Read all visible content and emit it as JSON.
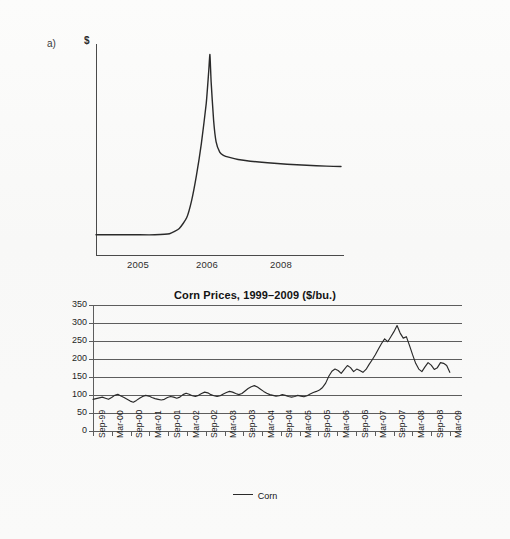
{
  "figure": {
    "background_color": "#fbfbfa",
    "line_color": "#2a2a2a"
  },
  "panel_a": {
    "letter": "a)",
    "y_axis_label": "$",
    "x_tick_labels": [
      "2005",
      "2006",
      "2008"
    ],
    "chart_data": {
      "type": "line",
      "title": "",
      "xlabel": "",
      "ylabel": "$",
      "grid": false,
      "legend": "none",
      "axis_style": "schematic (no numeric y scale)",
      "xtick_labels": [
        "2005",
        "2006",
        "2008"
      ],
      "xtick_positions": [
        0.18,
        0.46,
        0.76
      ],
      "description": "Stylized price spike: flat baseline, sharp exponential run-up to a peak just after 2006, abrupt collapse, then a slow decay settling slightly above the original baseline.",
      "series": [
        {
          "name": "price",
          "x": [
            0.0,
            0.08,
            0.16,
            0.24,
            0.3,
            0.34,
            0.37,
            0.39,
            0.41,
            0.43,
            0.45,
            0.46,
            0.465,
            0.47,
            0.48,
            0.49,
            0.505,
            0.52,
            0.545,
            0.58,
            0.63,
            0.7,
            0.78,
            0.86,
            0.94,
            1.0
          ],
          "y": [
            0.1,
            0.1,
            0.1,
            0.1,
            0.105,
            0.13,
            0.18,
            0.26,
            0.38,
            0.53,
            0.72,
            0.87,
            0.95,
            0.82,
            0.64,
            0.54,
            0.49,
            0.475,
            0.465,
            0.455,
            0.447,
            0.44,
            0.433,
            0.428,
            0.424,
            0.422
          ],
          "y_note": "values are normalized 0-1 of the plot height; no numeric scale shown on the figure"
        }
      ]
    }
  },
  "panel_b": {
    "letter": "b)",
    "title": "Corn Prices, 1999–2009 ($/bu.)",
    "legend_label": "Corn",
    "chart_data": {
      "type": "line",
      "title": "Corn Prices, 1999–2009 ($/bu.)",
      "xlabel": "",
      "ylabel": "",
      "ylim": [
        0,
        350
      ],
      "ytick_values": [
        0,
        50,
        100,
        150,
        200,
        250,
        300,
        350
      ],
      "grid": true,
      "grid_orientation": "horizontal",
      "legend": "bottom-center",
      "xtick_labels": [
        "Sep-99",
        "Mar-00",
        "Sep-00",
        "Mar-01",
        "Sep-01",
        "Mar-02",
        "Sep-02",
        "Mar-03",
        "Sep-03",
        "Mar-04",
        "Sep-04",
        "Mar-05",
        "Sep-05",
        "Mar-06",
        "Sep-06",
        "Mar-07",
        "Sep-07",
        "Mar-08",
        "Sep-08",
        "Mar-09"
      ],
      "xtick_interval_months": 6,
      "series": [
        {
          "name": "Corn",
          "values": [
            88,
            90,
            92,
            94,
            91,
            88,
            93,
            99,
            102,
            97,
            93,
            88,
            83,
            80,
            85,
            91,
            96,
            99,
            97,
            93,
            90,
            88,
            86,
            88,
            93,
            96,
            94,
            91,
            94,
            101,
            105,
            102,
            98,
            96,
            99,
            104,
            108,
            106,
            101,
            98,
            96,
            98,
            103,
            107,
            110,
            108,
            104,
            101,
            104,
            111,
            118,
            123,
            126,
            122,
            116,
            110,
            105,
            101,
            99,
            97,
            98,
            101,
            99,
            96,
            94,
            96,
            99,
            97,
            95,
            98,
            103,
            107,
            110,
            114,
            121,
            133,
            152,
            166,
            172,
            168,
            160,
            171,
            182,
            176,
            165,
            172,
            168,
            163,
            171,
            185,
            198,
            212,
            228,
            243,
            256,
            248,
            262,
            276,
            293,
            272,
            258,
            262,
            238,
            212,
            188,
            172,
            165,
            178,
            190,
            183,
            171,
            176,
            190,
            188,
            182,
            163
          ],
          "value_note": "cents per bushel read off the chart; monthly resolution Sep-1999 through Jun-2009"
        }
      ]
    }
  }
}
